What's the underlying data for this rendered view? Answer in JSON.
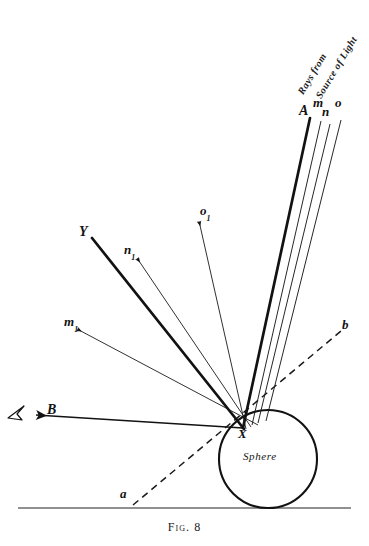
{
  "figure": {
    "caption": "Fig. 8",
    "sphere_label": "Sphere",
    "source_text_line1": "Rays from",
    "source_text_line2": "Source of Light",
    "ink_color": "#121212",
    "page_color": "#ffffff"
  },
  "labels": {
    "incident_A": "A",
    "incident_m": "m",
    "incident_n": "n",
    "incident_o": "o",
    "reflected_Y": "Y",
    "reflected_n1_base": "n",
    "reflected_n1_sub": "1",
    "reflected_m1_base": "m",
    "reflected_m1_sub": "1",
    "reflected_o1_base": "o",
    "reflected_o1_sub": "1",
    "reflected_B": "B",
    "point_X": "X",
    "axis_a": "a",
    "axis_b": "b"
  },
  "geometry": {
    "incidence_point": {
      "x": 243,
      "y": 428,
      "name": "X"
    },
    "sphere": {
      "cx": 268,
      "cy": 459,
      "r": 49
    },
    "baseline_y": 508,
    "incident_rays": [
      {
        "name": "A",
        "x1": 310,
        "y1": 118,
        "x2": 243,
        "y2": 428,
        "width": 2.6
      },
      {
        "name": "m",
        "x1": 321,
        "y1": 121,
        "x2": 252,
        "y2": 425,
        "width": 0.9
      },
      {
        "name": "n",
        "x1": 330,
        "y1": 124,
        "x2": 258,
        "y2": 423,
        "width": 0.9
      },
      {
        "name": "o",
        "x1": 341,
        "y1": 120,
        "x2": 266,
        "y2": 421,
        "width": 0.9
      }
    ],
    "reflected_rays": [
      {
        "name": "Y",
        "x1": 243,
        "y1": 428,
        "x2": 92,
        "y2": 238,
        "width": 2.6
      },
      {
        "name": "n1",
        "x1": 250,
        "y1": 426,
        "x2": 137,
        "y2": 258,
        "width": 0.8
      },
      {
        "name": "m1",
        "x1": 256,
        "y1": 424,
        "x2": 77,
        "y2": 329,
        "width": 0.8
      },
      {
        "name": "o1",
        "x1": 246,
        "y1": 428,
        "x2": 199,
        "y2": 221,
        "width": 0.8
      },
      {
        "name": "B",
        "x1": 243,
        "y1": 428,
        "x2": 34,
        "y2": 415,
        "width": 1.6
      }
    ],
    "axis_dashed": {
      "x1": 133,
      "y1": 505,
      "x2": 341,
      "y2": 331
    }
  }
}
